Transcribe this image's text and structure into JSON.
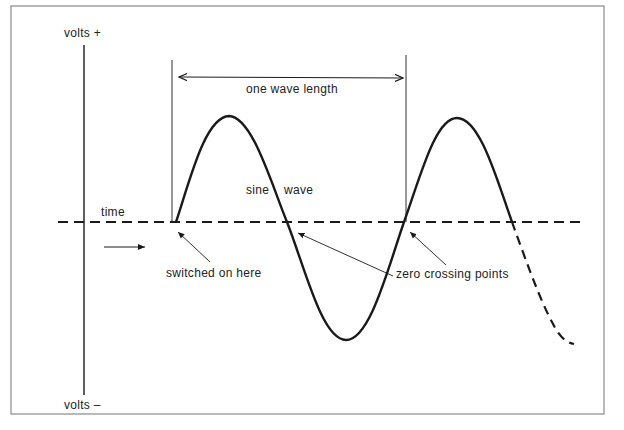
{
  "diagram": {
    "axis": {
      "top_label": "volts +",
      "bottom_label": "volts –",
      "time_label": "time"
    },
    "annotations": {
      "wavelength": "one wave length",
      "sine_label_1": "sine",
      "sine_label_2": "wave",
      "switched_on": "switched on here",
      "zero_crossing": "zero crossing points"
    },
    "colors": {
      "line": "#1a1a1a",
      "frame": "#8a8a8a",
      "background": "#ffffff"
    }
  }
}
